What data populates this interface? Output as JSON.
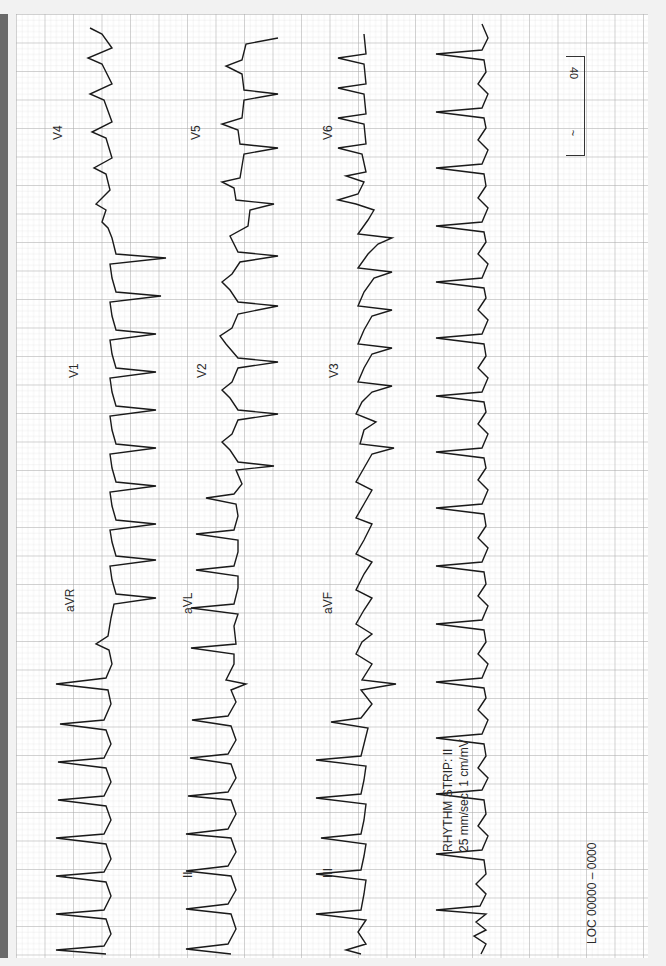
{
  "ecg": {
    "orientation": "rotated-90",
    "leads": {
      "I": "I",
      "II": "II",
      "III": "III",
      "aVR": "aVR",
      "aVL": "aVL",
      "aVF": "aVF",
      "V1": "V1",
      "V2": "V2",
      "V3": "V3",
      "V4": "V4",
      "V5": "V5",
      "V6": "V6"
    },
    "rhythm_strip": {
      "title": "RHYTHM STRIP: II",
      "settings": "25 mm/sec; 1 cm/mV"
    },
    "location": "LOC  00000 – 0000",
    "calibration_box": {
      "top": "40",
      "bottom": "~"
    },
    "colors": {
      "paper": "#ffffff",
      "grid_minor": "#d9d9d9",
      "grid_major": "#a8a8a8",
      "trace": "#1a1a1a",
      "side_bar": "#6a6a6a"
    }
  }
}
